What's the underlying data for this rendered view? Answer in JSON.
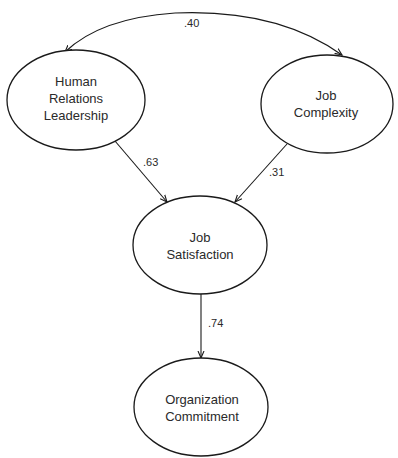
{
  "diagram": {
    "type": "path-model",
    "nodes": [
      {
        "id": "hrl",
        "lines": [
          "Human",
          "Relations",
          "Leadership"
        ],
        "cx": 76,
        "cy": 100,
        "rx": 69,
        "ry": 50
      },
      {
        "id": "jc",
        "lines": [
          "Job",
          "Complexity"
        ],
        "cx": 327,
        "cy": 104,
        "rx": 66,
        "ry": 49
      },
      {
        "id": "js",
        "lines": [
          "Job",
          "Satisfaction"
        ],
        "cx": 200,
        "cy": 245,
        "rx": 67,
        "ry": 49
      },
      {
        "id": "oc",
        "lines": [
          "Organization",
          "Commitment"
        ],
        "cx": 201,
        "cy": 407,
        "rx": 67,
        "ry": 49
      }
    ],
    "edges": [
      {
        "from": "hrl",
        "to": "jc",
        "kind": "correlation",
        "label": ".40"
      },
      {
        "from": "hrl",
        "to": "js",
        "kind": "path",
        "label": ".63"
      },
      {
        "from": "jc",
        "to": "js",
        "kind": "path",
        "label": ".31"
      },
      {
        "from": "js",
        "to": "oc",
        "kind": "path",
        "label": ".74"
      }
    ]
  }
}
